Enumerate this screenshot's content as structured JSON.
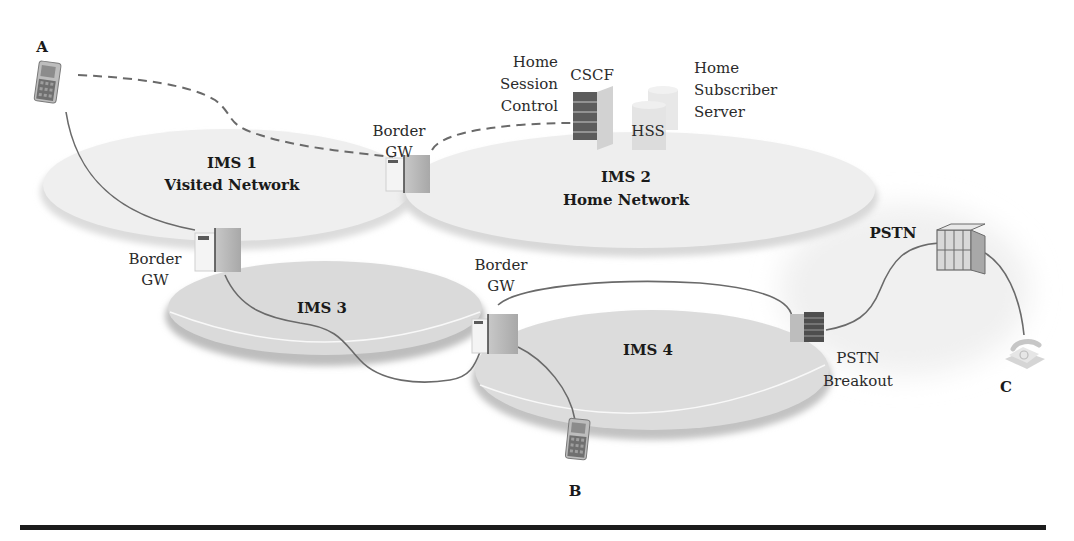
{
  "diagram": {
    "networks": [
      {
        "id": "ims1",
        "name": "IMS 1",
        "subtitle": "Visited Network"
      },
      {
        "id": "ims2",
        "name": "IMS 2",
        "subtitle": "Home Network"
      },
      {
        "id": "ims3",
        "name": "IMS 3",
        "subtitle": ""
      },
      {
        "id": "ims4",
        "name": "IMS 4",
        "subtitle": ""
      }
    ],
    "gateways": [
      {
        "id": "gw-ims1-ims2",
        "line1": "Border",
        "line2": "GW"
      },
      {
        "id": "gw-ims1-ims3",
        "line1": "Border",
        "line2": "GW"
      },
      {
        "id": "gw-ims3-ims4",
        "line1": "Border",
        "line2": "GW"
      }
    ],
    "cscf": {
      "label": "CSCF",
      "desc": [
        "Home",
        "Session",
        "Control"
      ]
    },
    "hss": {
      "label": "HSS",
      "desc": [
        "Home",
        "Subscriber",
        "Server"
      ]
    },
    "pstn": {
      "label": "PSTN"
    },
    "pstn_breakout": {
      "line1": "PSTN",
      "line2": "Breakout"
    },
    "endpoints": [
      {
        "id": "A",
        "label": "A",
        "type": "mobile-phone"
      },
      {
        "id": "B",
        "label": "B",
        "type": "mobile-phone"
      },
      {
        "id": "C",
        "label": "C",
        "type": "landline-phone"
      }
    ],
    "links": [
      {
        "from": "A",
        "to": "gw-ims1-ims2",
        "style": "dashed",
        "via": "signaling"
      },
      {
        "from": "gw-ims1-ims2",
        "to": "CSCF",
        "style": "dashed",
        "via": "signaling"
      },
      {
        "from": "A",
        "to": "gw-ims1-ims3",
        "style": "solid"
      },
      {
        "from": "gw-ims1-ims3",
        "to": "gw-ims3-ims4",
        "style": "solid"
      },
      {
        "from": "gw-ims3-ims4",
        "to": "pstn-breakout",
        "style": "solid"
      },
      {
        "from": "gw-ims3-ims4",
        "to": "B",
        "style": "solid"
      },
      {
        "from": "pstn-breakout",
        "to": "PSTN",
        "style": "solid"
      },
      {
        "from": "PSTN",
        "to": "C",
        "style": "solid"
      }
    ]
  }
}
